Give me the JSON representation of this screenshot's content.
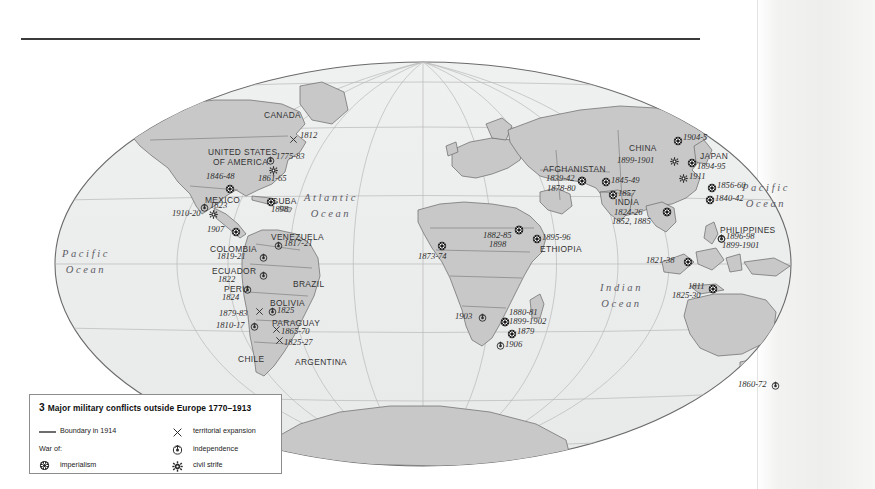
{
  "map": {
    "title_rule": true,
    "projection": "mollweide-oval",
    "ocean_labels": [
      {
        "id": "pacific-west",
        "line1": "Pacific",
        "line2": "Ocean",
        "x": 62,
        "y": 246
      },
      {
        "id": "atlantic",
        "line1": "Atlantic",
        "line2": "Ocean",
        "x": 304,
        "y": 190
      },
      {
        "id": "indian",
        "line1": "Indian",
        "line2": "Ocean",
        "x": 600,
        "y": 280
      },
      {
        "id": "pacific-east",
        "line1": "Pacific",
        "line2": "Ocean",
        "x": 742,
        "y": 180
      }
    ],
    "country_labels": [
      {
        "id": "canada",
        "text": "CANADA",
        "x": 264,
        "y": 111
      },
      {
        "id": "united-states",
        "text": "UNITED STATES",
        "x": 208,
        "y": 148
      },
      {
        "id": "of-america",
        "text": "OF AMERICA",
        "x": 213,
        "y": 158
      },
      {
        "id": "mexico",
        "text": "MEXICO",
        "x": 205,
        "y": 196
      },
      {
        "id": "cuba",
        "text": "CUBA",
        "x": 272,
        "y": 197
      },
      {
        "id": "venezuela",
        "text": "VENEZUELA",
        "x": 271,
        "y": 233
      },
      {
        "id": "colombia",
        "text": "COLOMBIA",
        "x": 210,
        "y": 245
      },
      {
        "id": "ecuador",
        "text": "ECUADOR",
        "x": 212,
        "y": 267
      },
      {
        "id": "peru",
        "text": "PERU",
        "x": 224,
        "y": 285
      },
      {
        "id": "brazil",
        "text": "BRAZIL",
        "x": 293,
        "y": 280
      },
      {
        "id": "bolivia",
        "text": "BOLIVIA",
        "x": 270,
        "y": 299
      },
      {
        "id": "paraguay",
        "text": "PARAGUAY",
        "x": 272,
        "y": 319
      },
      {
        "id": "chile",
        "text": "CHILE",
        "x": 238,
        "y": 355
      },
      {
        "id": "argentina",
        "text": "ARGENTINA",
        "x": 295,
        "y": 358
      },
      {
        "id": "ethiopia",
        "text": "ETHIOPIA",
        "x": 540,
        "y": 245
      },
      {
        "id": "afghanistan",
        "text": "AFGHANISTAN",
        "x": 543,
        "y": 165
      },
      {
        "id": "india",
        "text": "INDIA",
        "x": 615,
        "y": 198
      },
      {
        "id": "china",
        "text": "CHINA",
        "x": 629,
        "y": 144
      },
      {
        "id": "japan",
        "text": "JAPAN",
        "x": 700,
        "y": 152
      },
      {
        "id": "philippines",
        "text": "PHILIPPINES",
        "x": 720,
        "y": 226
      }
    ],
    "conflict_markers": [
      {
        "id": "usa-1812",
        "date": "1812",
        "type": "territorial-expansion",
        "sx": 289,
        "sy": 135,
        "tx": 300,
        "ty": 131
      },
      {
        "id": "usa-1775-83",
        "date": "1775-83",
        "type": "independence",
        "sx": 266,
        "sy": 156,
        "tx": 276,
        "ty": 152
      },
      {
        "id": "usa-1861-65",
        "date": "1861-65",
        "type": "civil-strife",
        "sx": 269,
        "sy": 166,
        "tx": 258,
        "ty": 174
      },
      {
        "id": "usa-1846-48",
        "date": "1846-48",
        "type": "imperialism",
        "sx": 225,
        "sy": 184,
        "tx": 206,
        "ty": 172
      },
      {
        "id": "mexico-1823",
        "date": "1823",
        "type": "independence",
        "sx": 200,
        "sy": 203,
        "tx": 210,
        "ty": 201
      },
      {
        "id": "cuba-1898",
        "date": "1898",
        "type": "imperialism",
        "sx": 266,
        "sy": 197,
        "tx": 271,
        "ty": 205
      },
      {
        "id": "mexico-1910-20",
        "date": "1910-20",
        "type": "civil-strife",
        "sx": 209,
        "sy": 210,
        "tx": 172,
        "ty": 209
      },
      {
        "id": "panama-1907",
        "date": "1907",
        "type": "imperialism",
        "sx": 231,
        "sy": 227,
        "tx": 207,
        "ty": 225
      },
      {
        "id": "venezuela-1817-21",
        "date": "1817-21",
        "type": "independence",
        "sx": 274,
        "sy": 241,
        "tx": 284,
        "ty": 239
      },
      {
        "id": "colombia-1819-21",
        "date": "1819-21",
        "type": "independence",
        "sx": 259,
        "sy": 253,
        "tx": 217,
        "ty": 252
      },
      {
        "id": "ecuador-1822",
        "date": "1822",
        "type": "independence",
        "sx": 259,
        "sy": 271,
        "tx": 218,
        "ty": 275
      },
      {
        "id": "peru-1824",
        "date": "1824",
        "type": "independence",
        "sx": 243,
        "sy": 285,
        "tx": 222,
        "ty": 293
      },
      {
        "id": "bolivia-1825",
        "date": "1825",
        "type": "independence",
        "sx": 268,
        "sy": 307,
        "tx": 277,
        "ty": 306
      },
      {
        "id": "chile-1879-83",
        "date": "1879-83",
        "type": "territorial-expansion",
        "sx": 255,
        "sy": 307,
        "tx": 219,
        "ty": 309
      },
      {
        "id": "chile-1810-17",
        "date": "1810-17",
        "type": "independence",
        "sx": 250,
        "sy": 322,
        "tx": 216,
        "ty": 321
      },
      {
        "id": "paraguay-1865-70",
        "date": "1865-70",
        "type": "territorial-expansion",
        "sx": 272,
        "sy": 325,
        "tx": 281,
        "ty": 327
      },
      {
        "id": "argentina-1825-27",
        "date": "1825-27",
        "type": "territorial-expansion",
        "sx": 275,
        "sy": 336,
        "tx": 284,
        "ty": 338
      },
      {
        "id": "west-africa-1873-74",
        "date": "1873-74",
        "type": "imperialism",
        "sx": 437,
        "sy": 241,
        "tx": 418,
        "ty": 252
      },
      {
        "id": "sudan-1882-85",
        "date": "1882-85",
        "type": "imperialism",
        "sx": 514,
        "sy": 225,
        "tx": 483,
        "ty": 231
      },
      {
        "id": "sudan-1898",
        "date": "1898",
        "type": "imperialism",
        "sx": 514,
        "sy": 225,
        "tx": 489,
        "ty": 240
      },
      {
        "id": "ethiopia-1895-96",
        "date": "1895-96",
        "type": "imperialism",
        "sx": 532,
        "sy": 234,
        "tx": 542,
        "ty": 233
      },
      {
        "id": "southwest-africa-1903",
        "date": "1903",
        "type": "independence",
        "sx": 478,
        "sy": 313,
        "tx": 455,
        "ty": 312
      },
      {
        "id": "boer-1880-81",
        "date": "1880-81",
        "type": "imperialism",
        "sx": 500,
        "sy": 317,
        "tx": 509,
        "ty": 308
      },
      {
        "id": "boer-1899-1902",
        "date": "1899-1902",
        "type": "imperialism",
        "sx": 500,
        "sy": 317,
        "tx": 509,
        "ty": 317
      },
      {
        "id": "zulu-1879",
        "date": "1879",
        "type": "imperialism",
        "sx": 507,
        "sy": 329,
        "tx": 517,
        "ty": 327
      },
      {
        "id": "natal-1906",
        "date": "1906",
        "type": "independence",
        "sx": 496,
        "sy": 341,
        "tx": 505,
        "ty": 340
      },
      {
        "id": "afghanistan-1839-42",
        "date": "1839-42",
        "type": "imperialism",
        "sx": 577,
        "sy": 176,
        "tx": 546,
        "ty": 174
      },
      {
        "id": "afghanistan-1878-80",
        "date": "1878-80",
        "type": "imperialism",
        "sx": 577,
        "sy": 176,
        "tx": 547,
        "ty": 184
      },
      {
        "id": "punjab-1845-49",
        "date": "1845-49",
        "type": "imperialism",
        "sx": 601,
        "sy": 177,
        "tx": 611,
        "ty": 176
      },
      {
        "id": "india-1857",
        "date": "1857",
        "type": "imperialism",
        "sx": 608,
        "sy": 190,
        "tx": 618,
        "ty": 189
      },
      {
        "id": "india-1824-26",
        "date": "1824-26",
        "type": "imperialism",
        "sx": 662,
        "sy": 207,
        "tx": 614,
        "ty": 208
      },
      {
        "id": "india-1852-1885",
        "date": "1852, 1885",
        "type": "imperialism",
        "sx": 662,
        "sy": 207,
        "tx": 612,
        "ty": 217
      },
      {
        "id": "china-1899-1901",
        "date": "1899-1901",
        "type": "civil-strife",
        "sx": 670,
        "sy": 157,
        "tx": 617,
        "ty": 156
      },
      {
        "id": "china-1904-5",
        "date": "1904-5",
        "type": "imperialism",
        "sx": 673,
        "sy": 136,
        "tx": 683,
        "ty": 133
      },
      {
        "id": "japan-1894-95",
        "date": "1894-95",
        "type": "imperialism",
        "sx": 687,
        "sy": 158,
        "tx": 697,
        "ty": 162
      },
      {
        "id": "china-1911",
        "date": "1911",
        "type": "civil-strife",
        "sx": 679,
        "sy": 174,
        "tx": 689,
        "ty": 172
      },
      {
        "id": "china-1856-60",
        "date": "1856-60",
        "type": "imperialism",
        "sx": 707,
        "sy": 183,
        "tx": 717,
        "ty": 181
      },
      {
        "id": "china-1840-42",
        "date": "1840-42",
        "type": "imperialism",
        "sx": 705,
        "sy": 195,
        "tx": 715,
        "ty": 194
      },
      {
        "id": "philippines-1896-98",
        "date": "1896-98",
        "type": "independence",
        "sx": 717,
        "sy": 234,
        "tx": 726,
        "ty": 232
      },
      {
        "id": "philippines-1899-1901",
        "date": "1899-1901",
        "type": "independence",
        "sx": 717,
        "sy": 234,
        "tx": 722,
        "ty": 241
      },
      {
        "id": "sumatra-1821-38",
        "date": "1821-38",
        "type": "imperialism",
        "sx": 683,
        "sy": 257,
        "tx": 646,
        "ty": 256
      },
      {
        "id": "java-1811",
        "date": "1811",
        "type": "imperialism",
        "sx": 708,
        "sy": 284,
        "tx": 688,
        "ty": 282
      },
      {
        "id": "java-1825-30",
        "date": "1825-30",
        "type": "imperialism",
        "sx": 708,
        "sy": 284,
        "tx": 672,
        "ty": 291
      },
      {
        "id": "newzealand-1860-72",
        "date": "1860-72",
        "type": "independence",
        "sx": 771,
        "sy": 381,
        "tx": 738,
        "ty": 380
      }
    ]
  },
  "legend": {
    "number": "3",
    "title": "Major military conflicts outside Europe 1770–1913",
    "title_full": "3 Major military conflicts outside Europe 1770–1913",
    "boundary_label": "Boundary in 1914",
    "war_of_label": "War of:",
    "imperialism_label": "imperialism",
    "territorial_expansion_label": "territorial expansion",
    "independence_label": "independence",
    "civil_strife_label": "civil strife",
    "symbols": {
      "boundary": "line-symbol",
      "imperialism": "imperialism-icon",
      "territorial_expansion": "cross-icon",
      "independence": "independence-icon",
      "civil_strife": "gear-icon"
    }
  },
  "colors": {
    "land": "#c9c9c9",
    "ocean": "#eceded",
    "outline": "#6f6f6f",
    "graticule": "#b4b4b4",
    "rule": "#3b3b3b",
    "text": "#2b2b2b",
    "legend_border": "#8d8d8d",
    "page_shade": "#eeeeec"
  }
}
